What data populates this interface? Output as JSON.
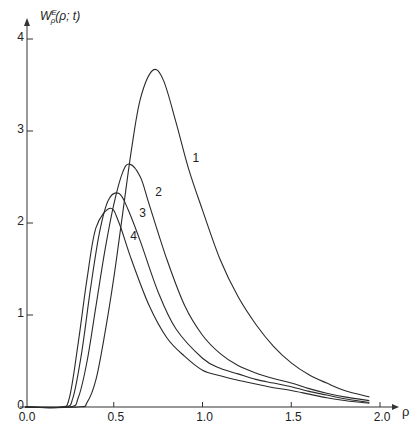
{
  "chart_data": {
    "type": "line",
    "title": "",
    "xlabel": "ρ",
    "ylabel": "W_ρ^E(ρ; t)",
    "xlim": [
      0.0,
      2.0
    ],
    "ylim": [
      0,
      4
    ],
    "grid": false,
    "legend": "inline curve labels 1-4",
    "x_ticks": [
      "0.0",
      "0.5",
      "1.0",
      "1.5",
      "2.0"
    ],
    "y_ticks": [
      "0",
      "1",
      "2",
      "3",
      "4"
    ],
    "series": [
      {
        "name": "1",
        "points": [
          [
            0.3,
            0
          ],
          [
            0.35,
            0.05
          ],
          [
            0.4,
            0.3
          ],
          [
            0.45,
            0.8
          ],
          [
            0.5,
            1.4
          ],
          [
            0.55,
            2.1
          ],
          [
            0.6,
            2.8
          ],
          [
            0.65,
            3.35
          ],
          [
            0.72,
            3.66
          ],
          [
            0.78,
            3.55
          ],
          [
            0.85,
            3.1
          ],
          [
            0.92,
            2.6
          ],
          [
            1.0,
            2.14
          ],
          [
            1.1,
            1.6
          ],
          [
            1.2,
            1.2
          ],
          [
            1.3,
            0.9
          ],
          [
            1.4,
            0.66
          ],
          [
            1.5,
            0.48
          ],
          [
            1.6,
            0.35
          ],
          [
            1.7,
            0.26
          ],
          [
            1.8,
            0.18
          ],
          [
            1.94,
            0.11
          ]
        ]
      },
      {
        "name": "2",
        "points": [
          [
            0.25,
            0
          ],
          [
            0.3,
            0.1
          ],
          [
            0.35,
            0.5
          ],
          [
            0.4,
            1.1
          ],
          [
            0.45,
            1.7
          ],
          [
            0.5,
            2.2
          ],
          [
            0.55,
            2.55
          ],
          [
            0.59,
            2.64
          ],
          [
            0.65,
            2.5
          ],
          [
            0.7,
            2.2
          ],
          [
            0.8,
            1.6
          ],
          [
            0.9,
            1.1
          ],
          [
            1.0,
            0.78
          ],
          [
            1.1,
            0.58
          ],
          [
            1.2,
            0.45
          ],
          [
            1.3,
            0.37
          ],
          [
            1.4,
            0.31
          ],
          [
            1.5,
            0.26
          ],
          [
            1.6,
            0.2
          ],
          [
            1.7,
            0.15
          ],
          [
            1.8,
            0.11
          ],
          [
            1.94,
            0.07
          ]
        ]
      },
      {
        "name": "3",
        "points": [
          [
            0.22,
            0
          ],
          [
            0.27,
            0.1
          ],
          [
            0.32,
            0.6
          ],
          [
            0.37,
            1.3
          ],
          [
            0.42,
            1.9
          ],
          [
            0.47,
            2.25
          ],
          [
            0.53,
            2.32
          ],
          [
            0.58,
            2.15
          ],
          [
            0.65,
            1.8
          ],
          [
            0.75,
            1.25
          ],
          [
            0.85,
            0.85
          ],
          [
            1.0,
            0.53
          ],
          [
            1.1,
            0.42
          ],
          [
            1.2,
            0.36
          ],
          [
            1.3,
            0.3
          ],
          [
            1.4,
            0.26
          ],
          [
            1.5,
            0.22
          ],
          [
            1.6,
            0.17
          ],
          [
            1.7,
            0.13
          ],
          [
            1.8,
            0.09
          ],
          [
            1.94,
            0.05
          ]
        ]
      },
      {
        "name": "4",
        "points": [
          [
            0.2,
            0
          ],
          [
            0.25,
            0.1
          ],
          [
            0.3,
            0.7
          ],
          [
            0.35,
            1.4
          ],
          [
            0.4,
            1.95
          ],
          [
            0.48,
            2.16
          ],
          [
            0.53,
            2.0
          ],
          [
            0.6,
            1.6
          ],
          [
            0.7,
            1.1
          ],
          [
            0.8,
            0.75
          ],
          [
            0.9,
            0.55
          ],
          [
            1.0,
            0.4
          ],
          [
            1.1,
            0.34
          ],
          [
            1.2,
            0.29
          ],
          [
            1.3,
            0.25
          ],
          [
            1.4,
            0.21
          ],
          [
            1.5,
            0.18
          ],
          [
            1.6,
            0.14
          ],
          [
            1.7,
            0.1
          ],
          [
            1.8,
            0.07
          ],
          [
            1.94,
            0.04
          ]
        ]
      }
    ],
    "curve_labels": [
      {
        "text": "1",
        "x": 0.96,
        "y": 2.7
      },
      {
        "text": "2",
        "x": 0.75,
        "y": 2.33
      },
      {
        "text": "3",
        "x": 0.66,
        "y": 2.1
      },
      {
        "text": "4",
        "x": 0.61,
        "y": 1.85
      }
    ]
  },
  "axes": {
    "y_label_main": "W",
    "y_label_sup": "E",
    "y_label_sub": "ρ",
    "y_label_args": "(ρ; t)",
    "x_label": "ρ"
  }
}
